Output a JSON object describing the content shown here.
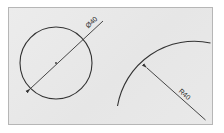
{
  "document": {
    "title": "Technical Drawing Sheet",
    "background_color": "#ffffff",
    "panel_color": "#e9e9e9",
    "panel_border_color": "#b6b6b6",
    "line_color": "#333333"
  },
  "figures": {
    "circle_figure": {
      "name": "Circle with diameter dimension",
      "dimension_label": "Ø40",
      "dimension_type": "diameter",
      "dimension_value": "40",
      "dimension_symbol": "Ø"
    },
    "arc_figure": {
      "name": "Arc with radius dimension",
      "dimension_label": "R40",
      "dimension_type": "radius",
      "dimension_value": "40",
      "dimension_symbol": "R"
    }
  }
}
